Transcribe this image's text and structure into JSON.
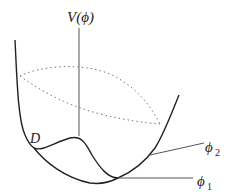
{
  "figure": {
    "type": "potential-energy-surface",
    "labels": {
      "potential": "V(ϕ)",
      "point_d": "D",
      "phi2_symbol": "ϕ",
      "phi2_sub": "2",
      "phi1_symbol": "ϕ",
      "phi1_sub": "1"
    },
    "colors": {
      "curve": "#222222",
      "axis": "#555555",
      "dotted": "#777777",
      "background": "#ffffff"
    }
  }
}
